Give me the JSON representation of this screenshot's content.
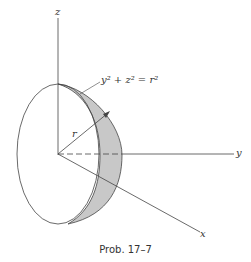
{
  "figure": {
    "axes": {
      "z": "z",
      "y": "y",
      "x": "x"
    },
    "radius_label": "r",
    "equation": "y² + z² = r²",
    "caption": "Prob. 17–7",
    "shade_color": "#c8c8c8",
    "line_color": "#444444"
  }
}
